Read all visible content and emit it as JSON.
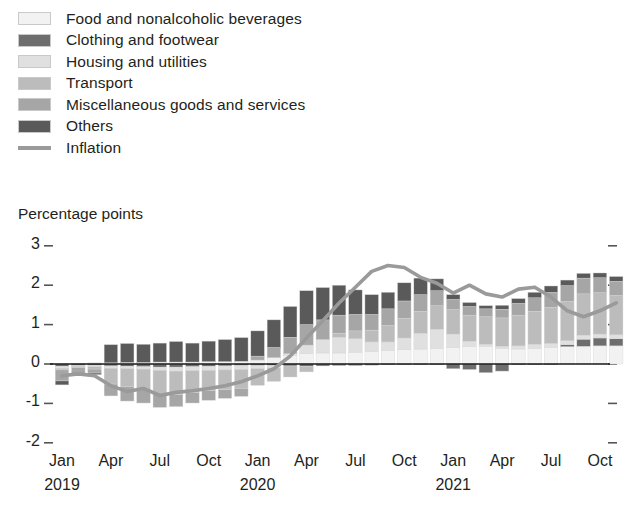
{
  "legend": {
    "items": [
      {
        "label": "Food and nonalcoholic beverages",
        "key": "food",
        "color": "#f2f2f2",
        "type": "box"
      },
      {
        "label": "Clothing and footwear",
        "key": "clothing",
        "color": "#6e6e6e",
        "type": "box"
      },
      {
        "label": "Housing and utilities",
        "key": "housing",
        "color": "#e0e0e0",
        "type": "box"
      },
      {
        "label": "Transport",
        "key": "transport",
        "color": "#bcbcbc",
        "type": "box"
      },
      {
        "label": "Miscellaneous goods and services",
        "key": "misc",
        "color": "#a6a6a6",
        "type": "box"
      },
      {
        "label": "Others",
        "key": "others",
        "color": "#5a5a5a",
        "type": "box"
      },
      {
        "label": "Inflation",
        "key": "inflation",
        "color": "#9a9a9a",
        "type": "line"
      }
    ]
  },
  "axis_title": "Percentage points",
  "chart_data": {
    "type": "bar",
    "title": "",
    "subtitle": "",
    "xlabel": "",
    "ylabel": "Percentage points",
    "ylim": [
      -2,
      3
    ],
    "yticks": [
      3,
      2,
      1,
      0,
      -1,
      -2
    ],
    "ytick_labels": [
      "3",
      "2",
      "1",
      "0",
      "-1",
      "-2"
    ],
    "grid": false,
    "legend_position": "top-left",
    "stacked": true,
    "right_axis_ticks": true,
    "x": [
      "Jan 2019",
      "Feb 2019",
      "Mar 2019",
      "Apr 2019",
      "May 2019",
      "Jun 2019",
      "Jul 2019",
      "Aug 2019",
      "Sep 2019",
      "Oct 2019",
      "Nov 2019",
      "Dec 2019",
      "Jan 2020",
      "Feb 2020",
      "Mar 2020",
      "Apr 2020",
      "May 2020",
      "Jun 2020",
      "Jul 2020",
      "Aug 2020",
      "Sep 2020",
      "Oct 2020",
      "Nov 2020",
      "Dec 2020",
      "Jan 2021",
      "Feb 2021",
      "Mar 2021",
      "Apr 2021",
      "May 2021",
      "Jun 2021",
      "Jul 2021",
      "Aug 2021",
      "Sep 2021",
      "Oct 2021",
      "Nov 2021"
    ],
    "xtick_labels": [
      {
        "label": "Jan",
        "index": 0
      },
      {
        "label": "Apr",
        "index": 3
      },
      {
        "label": "Jul",
        "index": 6
      },
      {
        "label": "Oct",
        "index": 9
      },
      {
        "label": "Jan",
        "index": 12
      },
      {
        "label": "Apr",
        "index": 15
      },
      {
        "label": "Jul",
        "index": 18
      },
      {
        "label": "Oct",
        "index": 21
      },
      {
        "label": "Jan",
        "index": 24
      },
      {
        "label": "Apr",
        "index": 27
      },
      {
        "label": "Jul",
        "index": 30
      },
      {
        "label": "Oct",
        "index": 33
      }
    ],
    "xyear_labels": [
      {
        "label": "2019",
        "index": 0
      },
      {
        "label": "2020",
        "index": 12
      },
      {
        "label": "2021",
        "index": 24
      }
    ],
    "series": [
      {
        "name": "Food and nonalcoholic beverages",
        "key": "food",
        "color": "#f2f2f2",
        "values": [
          0.0,
          0.02,
          0.03,
          0.03,
          0.04,
          0.04,
          0.05,
          0.05,
          0.05,
          0.06,
          0.06,
          0.07,
          0.1,
          0.16,
          0.22,
          0.26,
          0.28,
          0.28,
          0.3,
          0.32,
          0.34,
          0.36,
          0.38,
          0.4,
          0.42,
          0.44,
          0.45,
          0.4,
          0.38,
          0.4,
          0.42,
          0.44,
          0.45,
          0.46,
          0.46
        ]
      },
      {
        "name": "Clothing and footwear",
        "key": "clothing",
        "color": "#6e6e6e",
        "values": [
          -0.06,
          -0.04,
          -0.03,
          -0.05,
          -0.06,
          -0.07,
          -0.08,
          -0.08,
          -0.07,
          -0.06,
          -0.05,
          -0.04,
          -0.04,
          -0.04,
          -0.05,
          -0.06,
          -0.05,
          -0.04,
          -0.04,
          -0.03,
          -0.02,
          -0.02,
          -0.02,
          -0.02,
          -0.12,
          -0.14,
          -0.22,
          -0.18,
          -0.02,
          -0.02,
          -0.02,
          0.05,
          0.18,
          0.2,
          0.18
        ]
      },
      {
        "name": "Housing and utilities",
        "key": "housing",
        "color": "#e0e0e0",
        "values": [
          -0.05,
          -0.02,
          -0.04,
          -0.06,
          -0.06,
          -0.06,
          -0.08,
          -0.1,
          -0.1,
          -0.1,
          -0.1,
          -0.1,
          -0.08,
          -0.06,
          0.04,
          0.22,
          0.34,
          0.4,
          0.34,
          0.24,
          0.22,
          0.3,
          0.4,
          0.48,
          0.34,
          0.14,
          0.05,
          0.05,
          0.08,
          0.1,
          0.1,
          0.1,
          0.1,
          0.1,
          0.1
        ]
      },
      {
        "name": "Transport",
        "key": "transport",
        "color": "#bcbcbc",
        "values": [
          -0.04,
          -0.03,
          -0.06,
          -0.4,
          -0.46,
          -0.52,
          -0.62,
          -0.6,
          -0.56,
          -0.52,
          -0.5,
          -0.48,
          -0.42,
          -0.34,
          -0.28,
          -0.14,
          0.0,
          0.1,
          0.2,
          0.3,
          0.42,
          0.5,
          0.56,
          0.6,
          0.62,
          0.66,
          0.7,
          0.72,
          0.78,
          0.84,
          0.92,
          1.0,
          1.05,
          1.05,
          1.0
        ]
      },
      {
        "name": "Miscellaneous goods and services",
        "key": "misc",
        "color": "#a6a6a6",
        "values": [
          -0.28,
          -0.12,
          -0.1,
          -0.3,
          -0.36,
          -0.34,
          -0.32,
          -0.3,
          -0.26,
          -0.24,
          -0.22,
          -0.2,
          0.1,
          0.26,
          0.42,
          0.52,
          0.5,
          0.46,
          0.42,
          0.4,
          0.42,
          0.44,
          0.42,
          0.38,
          0.26,
          0.22,
          0.2,
          0.22,
          0.3,
          0.34,
          0.38,
          0.4,
          0.4,
          0.38,
          0.36
        ],
        "note": "rendered as part of transport band where indistinguishable"
      },
      {
        "name": "Others",
        "key": "others",
        "color": "#5a5a5a",
        "values": [
          -0.1,
          -0.04,
          -0.04,
          0.46,
          0.48,
          0.46,
          0.48,
          0.52,
          0.48,
          0.52,
          0.56,
          0.6,
          0.64,
          0.7,
          0.78,
          0.86,
          0.82,
          0.76,
          0.62,
          0.5,
          0.42,
          0.46,
          0.42,
          0.3,
          0.12,
          0.1,
          0.08,
          0.1,
          0.12,
          0.14,
          0.16,
          0.14,
          0.12,
          0.12,
          0.12
        ]
      }
    ],
    "line_series": {
      "name": "Inflation",
      "key": "inflation",
      "color": "#9a9a9a",
      "values": [
        -0.3,
        -0.25,
        -0.3,
        -0.55,
        -0.7,
        -0.62,
        -0.8,
        -0.72,
        -0.68,
        -0.62,
        -0.55,
        -0.45,
        -0.3,
        -0.12,
        0.2,
        0.66,
        1.1,
        1.55,
        1.95,
        2.35,
        2.5,
        2.45,
        2.2,
        2.05,
        1.8,
        2.0,
        1.78,
        1.7,
        1.9,
        1.95,
        1.7,
        1.35,
        1.2,
        1.35,
        1.55
      ]
    }
  }
}
